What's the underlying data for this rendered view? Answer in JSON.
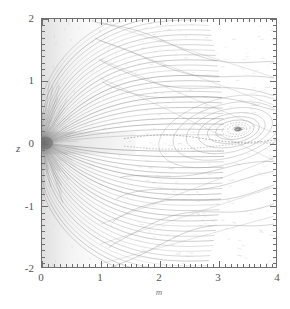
{
  "figure": {
    "title": "",
    "axis_color": "#6f6f6f",
    "background": "#ffffff",
    "stream_color": "#7a7a7a",
    "contour_color": "#8a8a8a",
    "arrow_color": "#9a9a9a"
  },
  "axes": {
    "x_title": "m",
    "y_title": "z",
    "x_ticks": [
      "0",
      "1",
      "2",
      "3",
      "4"
    ],
    "y_ticks": [
      "2",
      "1",
      "0",
      "-1",
      "-2"
    ]
  },
  "chart_data": {
    "type": "line",
    "title": "",
    "subtitle": "",
    "xlabel": "m",
    "ylabel": "z",
    "xlim": [
      0,
      4
    ],
    "ylim": [
      -2,
      2
    ],
    "xticks": [
      0,
      1,
      2,
      3,
      4
    ],
    "yticks": [
      -2,
      -1,
      0,
      1,
      2
    ],
    "x_minor_interval": 0.1,
    "y_minor_interval": 0.1,
    "grid": false,
    "legend": null,
    "tick_direction": "in",
    "frame": "box",
    "features": [
      {
        "name": "radial-source",
        "type": "focus",
        "x": 0.05,
        "y": 0.0,
        "shading": "dark-gray",
        "note": "dense dark region at origin where streamlines converge"
      },
      {
        "name": "vortex-eye",
        "type": "closed-contour-center",
        "x": 3.35,
        "y": 0.22,
        "note": "center of closed nested contour loops"
      },
      {
        "name": "shear-layer",
        "type": "separatrix",
        "y": 0.05,
        "x_range": [
          1.4,
          4.0
        ],
        "note": "dashed/dotted separating streamline along midplane"
      },
      {
        "name": "jet-core-band",
        "type": "shaded-band",
        "x_range": [
          0.0,
          1.6
        ],
        "y_range": [
          -0.18,
          0.18
        ],
        "note": "light gray shaded horizontal band of the jet core"
      }
    ],
    "series": [
      {
        "name": "radial-streamlines-upper",
        "type": "line",
        "origin": [
          0.02,
          0.0
        ],
        "count": 26,
        "angles_deg": [
          6,
          10,
          14,
          18,
          22,
          26,
          30,
          34,
          38,
          42,
          46,
          50,
          54,
          58,
          62,
          66,
          70,
          74,
          78,
          82,
          86,
          90,
          94,
          98,
          102,
          106
        ],
        "note": "fan of streamlines radiating up-left from the source"
      },
      {
        "name": "radial-streamlines-lower",
        "type": "line",
        "origin": [
          0.02,
          0.0
        ],
        "count": 26,
        "angles_deg": [
          -6,
          -10,
          -14,
          -18,
          -22,
          -26,
          -30,
          -34,
          -38,
          -42,
          -46,
          -50,
          -54,
          -58,
          -62,
          -66,
          -70,
          -74,
          -78,
          -82,
          -86,
          -90,
          -94,
          -98,
          -102,
          -106
        ],
        "note": "mirror fan of streamlines radiating down-left from the source"
      },
      {
        "name": "vortex-contours",
        "type": "closed-loop",
        "center": [
          3.35,
          0.22
        ],
        "levels": [
          0.06,
          0.13,
          0.22,
          0.33,
          0.46,
          0.62,
          0.8,
          1.0
        ],
        "note": "nested elongated loops surrounding the vortex eye"
      },
      {
        "name": "outer-contours",
        "type": "open-curve",
        "count": 9,
        "note": "broad open contours sweeping from upper-left to lower-right across the right half"
      }
    ],
    "arrows": {
      "name": "velocity-vectors",
      "type": "quiver",
      "region": [
        [
          1.6,
          -2.0
        ],
        [
          4.0,
          2.0
        ]
      ],
      "approx_count": 260,
      "note": "short faint velocity vectors filling the right two-thirds of the domain"
    }
  }
}
